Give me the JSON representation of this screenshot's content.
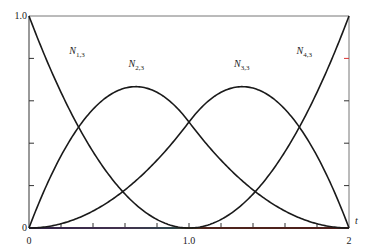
{
  "chart_data": {
    "type": "line",
    "title": "",
    "xlabel": "t",
    "ylabel": "",
    "xlim": [
      0,
      2
    ],
    "ylim": [
      0,
      1
    ],
    "grid": false,
    "knot_vector": [
      0,
      0,
      0,
      1,
      2,
      2,
      2
    ],
    "order": 3,
    "x_tick_labels": [
      {
        "value": 0,
        "label": "0"
      },
      {
        "value": 1,
        "label": "1.0"
      },
      {
        "value": 2,
        "label": "2"
      }
    ],
    "x_minor_ticks": [
      0.2,
      0.4,
      0.6,
      0.8,
      1.0,
      1.2,
      1.4,
      1.6,
      1.8
    ],
    "y_tick_labels": [
      {
        "value": 0,
        "label": "0"
      },
      {
        "value": 1,
        "label": "1.0"
      }
    ],
    "y_minor_ticks": [
      0.2,
      0.4,
      0.6,
      0.8
    ],
    "series": [
      {
        "name": "N1,3",
        "main": "N",
        "sub": "1,3",
        "label_pos": [
          0.3,
          0.82
        ],
        "x": [
          0,
          0.25,
          0.5,
          0.75,
          1.0,
          1.25,
          1.5,
          1.75,
          2.0
        ],
        "values": [
          1.0,
          0.5625,
          0.25,
          0.0625,
          0,
          0,
          0,
          0,
          0
        ]
      },
      {
        "name": "N2,3",
        "main": "N",
        "sub": "2,3",
        "label_pos": [
          0.67,
          0.76
        ],
        "x": [
          0,
          0.25,
          0.5,
          0.75,
          1.0,
          1.25,
          1.5,
          1.75,
          2.0
        ],
        "values": [
          0,
          0.40625,
          0.625,
          0.65625,
          0.5,
          0.28125,
          0.125,
          0.03125,
          0
        ]
      },
      {
        "name": "N3,3",
        "main": "N",
        "sub": "3,3",
        "label_pos": [
          1.33,
          0.76
        ],
        "x": [
          0,
          0.25,
          0.5,
          0.75,
          1.0,
          1.25,
          1.5,
          1.75,
          2.0
        ],
        "values": [
          0,
          0.03125,
          0.125,
          0.28125,
          0.5,
          0.65625,
          0.625,
          0.40625,
          0
        ]
      },
      {
        "name": "N4,3",
        "main": "N",
        "sub": "4,3",
        "label_pos": [
          1.72,
          0.82
        ],
        "x": [
          0,
          0.25,
          0.5,
          0.75,
          1.0,
          1.25,
          1.5,
          1.75,
          2.0
        ],
        "values": [
          0,
          0,
          0,
          0,
          0,
          0.0625,
          0.25,
          0.5625,
          1.0
        ]
      }
    ],
    "colors": {
      "curve": "#1a1a1a",
      "axis": "#555555",
      "frame": "#777777"
    }
  }
}
